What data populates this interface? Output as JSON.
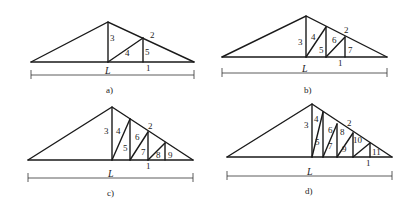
{
  "figure": {
    "panels": [
      {
        "id": "a",
        "caption": "a)",
        "span_label": "L",
        "member_labels": {
          "bottom_chord": "1",
          "top_chord": "2",
          "m3": "3",
          "m4": "4",
          "m5": "5"
        }
      },
      {
        "id": "b",
        "caption": "b)",
        "span_label": "L",
        "member_labels": {
          "bottom_chord": "1",
          "top_chord": "2",
          "m3": "3",
          "m4": "4",
          "m5": "5",
          "m6": "6",
          "m7": "7"
        }
      },
      {
        "id": "c",
        "caption": "c)",
        "span_label": "L",
        "member_labels": {
          "bottom_chord": "1",
          "top_chord": "2",
          "m3": "3",
          "m4": "4",
          "m5": "5",
          "m6": "6",
          "m7": "7",
          "m8": "8",
          "m9": "9"
        }
      },
      {
        "id": "d",
        "caption": "d)",
        "span_label": "L",
        "member_labels": {
          "bottom_chord": "1",
          "top_chord": "2",
          "m3": "3",
          "m4": "4",
          "m5": "5",
          "m6": "6",
          "m7": "7",
          "m8": "8",
          "m9": "9",
          "m10": "10",
          "m11": "11"
        }
      }
    ]
  }
}
